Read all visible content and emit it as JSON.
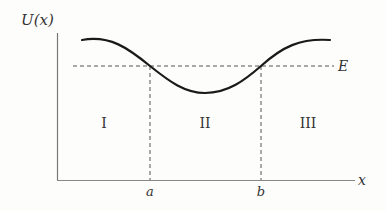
{
  "diagram": {
    "y_axis_label": "U(x)",
    "x_axis_label": "x",
    "energy_label": "E",
    "turning_points": [
      {
        "label": "a"
      },
      {
        "label": "b"
      }
    ],
    "regions": [
      {
        "label": "I"
      },
      {
        "label": "II"
      },
      {
        "label": "III"
      }
    ],
    "colors": {
      "curve": "#1a1a1a",
      "axis": "#777777",
      "dashed": "#555555",
      "text": "#333333"
    }
  }
}
